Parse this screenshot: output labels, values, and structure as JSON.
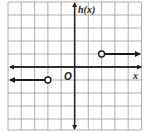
{
  "graph": {
    "y_axis_label": "h(x)",
    "x_axis_label": "x",
    "origin_label": "O",
    "grid": {
      "cells_x": 10,
      "cells_y": 10,
      "x_range": [
        -5,
        5
      ],
      "y_range": [
        -5,
        5
      ]
    },
    "colors": {
      "grid": "#9a9a9a",
      "axis": "#222222",
      "ray": "#1a1a1a",
      "background": "#ffffff"
    },
    "pieces": [
      {
        "type": "ray",
        "start": [
          2,
          1
        ],
        "direction": "right",
        "endpoint": "open"
      },
      {
        "type": "ray",
        "start": [
          -2,
          -1
        ],
        "direction": "left",
        "endpoint": "open"
      }
    ]
  }
}
